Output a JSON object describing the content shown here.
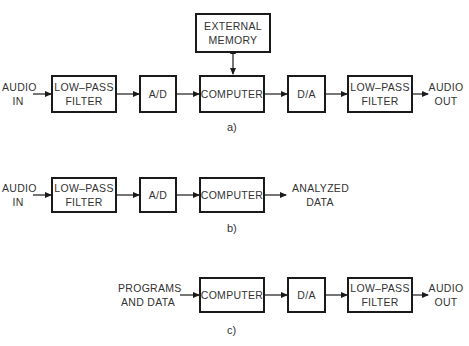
{
  "diagram": {
    "a": {
      "caption": "a)",
      "input_label": "AUDIO\nIN",
      "output_label": "AUDIO\nOUT",
      "blocks": {
        "lpf_in": "LOW–PASS\nFILTER",
        "ad": "A/D",
        "computer": "COMPUTER",
        "memory": "EXTERNAL\nMEMORY",
        "da": "D/A",
        "lpf_out": "LOW–PASS\nFILTER"
      }
    },
    "b": {
      "caption": "b)",
      "input_label": "AUDIO\nIN",
      "output_label": "ANALYZED\nDATA",
      "blocks": {
        "lpf_in": "LOW–PASS\nFILTER",
        "ad": "A/D",
        "computer": "COMPUTER"
      }
    },
    "c": {
      "caption": "c)",
      "input_label": "PROGRAMS\nAND DATA",
      "output_label": "AUDIO\nOUT",
      "blocks": {
        "computer": "COMPUTER",
        "da": "D/A",
        "lpf_out": "LOW–PASS\nFILTER"
      }
    }
  }
}
